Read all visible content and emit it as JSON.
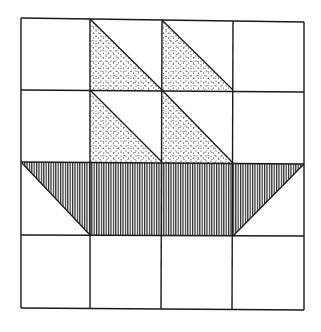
{
  "diagram": {
    "grid": {
      "rows": 4,
      "cols": 4
    },
    "colors": {
      "line": "#1a1a1a",
      "background": "#ffffff",
      "stipple": "#222222",
      "hatch": "#222222"
    },
    "shapes": [
      {
        "name": "sail-upper-left",
        "fill": "stipple",
        "cell": [
          0,
          1
        ]
      },
      {
        "name": "sail-upper-right",
        "fill": "stipple",
        "cell": [
          0,
          2
        ]
      },
      {
        "name": "sail-lower-left",
        "fill": "stipple",
        "cell": [
          1,
          1
        ]
      },
      {
        "name": "sail-lower-right",
        "fill": "stipple",
        "cell": [
          1,
          2
        ]
      },
      {
        "name": "hull",
        "fill": "vertical-hatch",
        "row": 2
      }
    ]
  }
}
